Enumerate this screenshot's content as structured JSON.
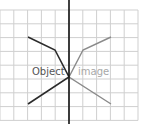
{
  "diagram": {
    "type": "reflection",
    "grid": {
      "x0": 0,
      "y0": 10,
      "cell": 13.8,
      "cols": 10,
      "rows": 8,
      "color": "#cfcfcf"
    },
    "mirror_line": {
      "x": 69,
      "y1": 0,
      "y2": 124,
      "color": "#111111"
    },
    "object": {
      "label": "Object",
      "color": "#2b2b2b",
      "label_color": "#555555",
      "points": [
        [
          28,
          37
        ],
        [
          55,
          50
        ],
        [
          69,
          77
        ],
        [
          28,
          104
        ]
      ]
    },
    "image": {
      "label": "image",
      "color": "#8a8a8a",
      "label_color": "#a8a8a8",
      "points": [
        [
          111,
          37
        ],
        [
          83,
          50
        ],
        [
          69,
          77
        ],
        [
          111,
          104
        ]
      ]
    }
  }
}
